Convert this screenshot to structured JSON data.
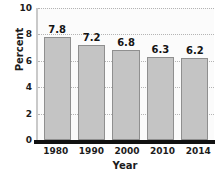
{
  "chart_data": {
    "type": "bar",
    "title": "",
    "xlabel": "Year",
    "ylabel": "Percent",
    "categories": [
      "1980",
      "1990",
      "2000",
      "2010",
      "2014"
    ],
    "values": [
      7.8,
      7.2,
      6.8,
      6.3,
      6.2
    ],
    "data_labels": [
      "7.8",
      "7.2",
      "6.8",
      "6.3",
      "6.2"
    ],
    "ylim": [
      0,
      10
    ],
    "yticks": [
      0,
      2,
      4,
      6,
      8,
      10
    ],
    "ytick_labels": [
      "0",
      "2",
      "4",
      "6",
      "8",
      "10"
    ],
    "grid": true,
    "grid_axis": "y",
    "legend": "none",
    "bar_color": "#c4c4c4",
    "bar_edge_color": "#8f8f8f",
    "axis_color": "#111111",
    "gridline_color": "#b4b4b4",
    "plot_background": "#fbfbfb",
    "text_color": "#1c1c1c"
  }
}
